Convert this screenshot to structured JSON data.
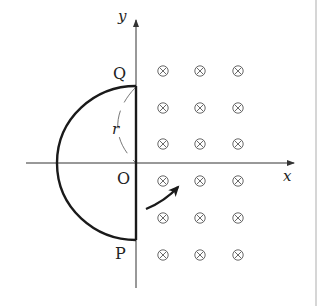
{
  "figure": {
    "type": "physics-diagram",
    "axes": {
      "x_label": "x",
      "y_label": "y",
      "origin_label": "O"
    },
    "points": {
      "top_label": "Q",
      "bottom_label": "P"
    },
    "radius_label": "r",
    "field": {
      "symbol": "⊗",
      "meaning": "magnetic field into the page",
      "region": "x > 0",
      "columns": 3,
      "rows": 6
    },
    "rotation_arrow": "clockwise rotation indicator",
    "colors": {
      "line": "#1a1a1a",
      "axis": "#333333",
      "marker": "#6a6a6a",
      "border": "#c8c8c8"
    }
  }
}
